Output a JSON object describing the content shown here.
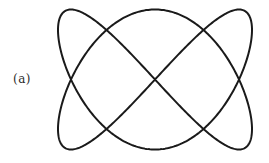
{
  "figure": {
    "label": "(a)",
    "curve": {
      "type": "lissajous",
      "x_frequency": 2,
      "y_frequency": 3,
      "x_phase": 0,
      "y_phase": 0,
      "color": "#1a1a1a"
    }
  }
}
